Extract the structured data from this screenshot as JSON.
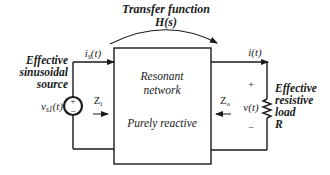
{
  "title": {
    "line1": "Transfer function",
    "line2": "H(s)"
  },
  "network": {
    "line1": "Resonant",
    "line2": "network",
    "line3": "Purely reactive"
  },
  "source": {
    "label_line1": "Effective",
    "label_line2": "sinusoidal",
    "label_line3": "source",
    "voltage_label": "v",
    "voltage_sub": "s1",
    "voltage_arg": "(t)",
    "plus": "+",
    "minus": "−"
  },
  "input_current": {
    "label": "i",
    "sub": "s",
    "arg": "(t)"
  },
  "output_current": {
    "label": "i(t)"
  },
  "input_impedance": {
    "label": "Z",
    "sub": "i"
  },
  "output_impedance": {
    "label": "Z",
    "sub": "o"
  },
  "load": {
    "voltage": "v(t)",
    "plus": "+",
    "minus": "−",
    "label_line1": "Effective",
    "label_line2": "resistive",
    "label_line3": "load",
    "label_line4": "R"
  },
  "colors": {
    "ink": "#1a1a1a",
    "background": "#ffffff"
  }
}
